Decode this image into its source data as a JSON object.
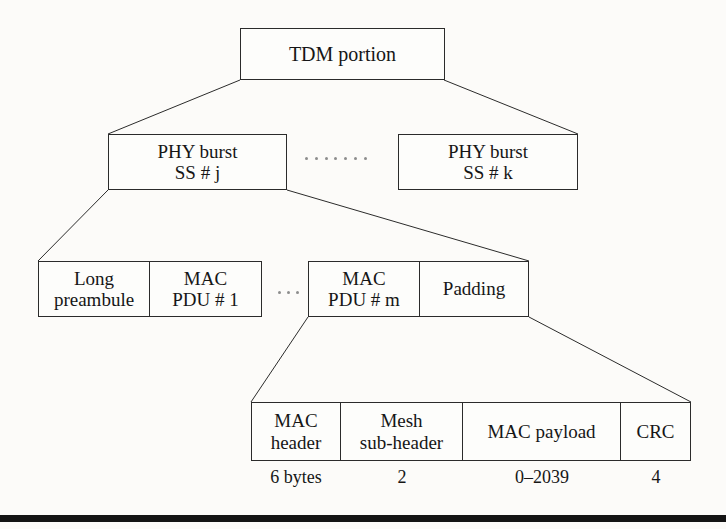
{
  "diagram": {
    "title_node": {
      "label": "TDM portion"
    },
    "phy_bursts": [
      {
        "line1": "PHY burst",
        "line2": "SS # j"
      },
      {
        "line1": "PHY burst",
        "line2": "SS # k"
      }
    ],
    "burst_segments": [
      {
        "line1": "Long",
        "line2": "preambule"
      },
      {
        "line1": "MAC",
        "line2": "PDU # 1"
      },
      {
        "line1": "MAC",
        "line2": "PDU # m"
      },
      {
        "line1": "Padding",
        "line2": ""
      }
    ],
    "pdu_fields": [
      {
        "line1": "MAC",
        "line2": "header",
        "size": "6 bytes"
      },
      {
        "line1": "Mesh",
        "line2": "sub-header",
        "size": "2"
      },
      {
        "line1": "MAC payload",
        "line2": "",
        "size": "0–2039"
      },
      {
        "line1": "CRC",
        "line2": "",
        "size": "4"
      }
    ],
    "ellipsis": {
      "burst_gap_dots": 7,
      "pdu_gap_dots": 3
    },
    "colors": {
      "stroke": "#2b2b2b",
      "text": "#161616",
      "page_background": "#fcfbf9",
      "box_fill": "#fdfdfb",
      "dot": "#8d8d8d",
      "bottom_rule": "#141414"
    }
  }
}
